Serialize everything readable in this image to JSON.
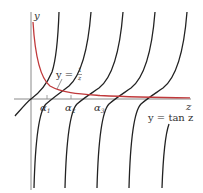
{
  "figure": {
    "type": "function-plot",
    "axes": {
      "x_label": "z",
      "y_label": "y"
    },
    "curves": [
      {
        "name": "tan-curve",
        "label": "y = tan z",
        "color": "#222222"
      },
      {
        "name": "reciprocal-curve",
        "label_prefix": "y =",
        "label_num": "1",
        "label_den": "z",
        "color": "#c0393b"
      }
    ],
    "intersections": [
      {
        "label": "α",
        "subscript": "1"
      },
      {
        "label": "α",
        "subscript": "2"
      },
      {
        "label": "α",
        "subscript": "3"
      }
    ],
    "colors": {
      "axis": "#888888",
      "tan": "#222222",
      "reciprocal": "#c0393b",
      "background": "#ffffff"
    }
  }
}
